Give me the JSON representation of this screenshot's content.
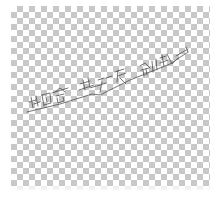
{
  "image": {
    "background": "transparency-checkerboard",
    "checker_colors": [
      "#ffffff",
      "#c8c8c8"
    ],
    "stroke_color": "#4a4a4a"
  },
  "sketch": {
    "description": "faint hand-drawn diagonal line of Chinese-style characters",
    "text_guess": "北白合一缀上文乐创造"
  }
}
